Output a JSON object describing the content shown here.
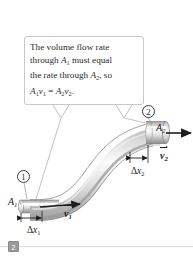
{
  "figure": {
    "type": "physics-diagram"
  },
  "callout": {
    "line1": "The volume flow rate",
    "line2_pre": "through ",
    "line2_sym": "A",
    "line2_sub": "1",
    "line2_post": " must equal",
    "line3_pre": "the rate through ",
    "line3_sym": "A",
    "line3_sub": "2",
    "line3_post": ", so",
    "equation": {
      "a1": "A",
      "a1sub": "1",
      "v1": "v",
      "v1sub": "1",
      "eq": " = ",
      "a2": "A",
      "a2sub": "2",
      "v2": "v",
      "v2sub": "2",
      "period": "."
    }
  },
  "labels": {
    "area_1": {
      "sym": "A",
      "sub": "1"
    },
    "area_2": {
      "sym": "A",
      "sub": "2"
    },
    "delta_x1": {
      "delta": "Δ",
      "sym": "x",
      "sub": "1"
    },
    "delta_x2": {
      "delta": "Δ",
      "sym": "x",
      "sub": "2"
    },
    "velocity_1": {
      "sym": "v",
      "sub": "1"
    },
    "velocity_2": {
      "sym": "v",
      "sub": "2"
    },
    "point_1": "1",
    "point_2": "2"
  },
  "slide": {
    "badge_number": "2"
  },
  "colors": {
    "pipe_light": "#fdfdfd",
    "pipe_mid": "#d6d6d6",
    "pipe_dark": "#9c9c9c",
    "outline": "#6e6e6e",
    "callout_border": "#c8c8cc",
    "text": "#1e1e1e",
    "badge": "#9a9a9a",
    "rule": "#dcdcdc"
  }
}
